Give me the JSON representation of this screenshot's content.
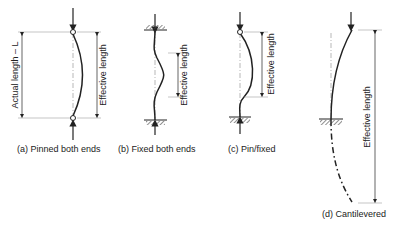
{
  "diagram": {
    "panels": [
      {
        "id": "a",
        "caption": "(a) Pinned both ends",
        "dimension_labels": [
          "Actual length – L",
          "Effective length"
        ]
      },
      {
        "id": "b",
        "caption": "(b) Fixed both ends",
        "dimension_labels": [
          "Effective length"
        ]
      },
      {
        "id": "c",
        "caption": "(c) Pin/fixed",
        "dimension_labels": [
          "Effective length"
        ]
      },
      {
        "id": "d",
        "caption": "(d) Cantilevered",
        "dimension_labels": [
          "Effective length"
        ]
      }
    ],
    "colors": {
      "line": "#222222",
      "guide": "#888888",
      "hatch": "#555555"
    }
  }
}
